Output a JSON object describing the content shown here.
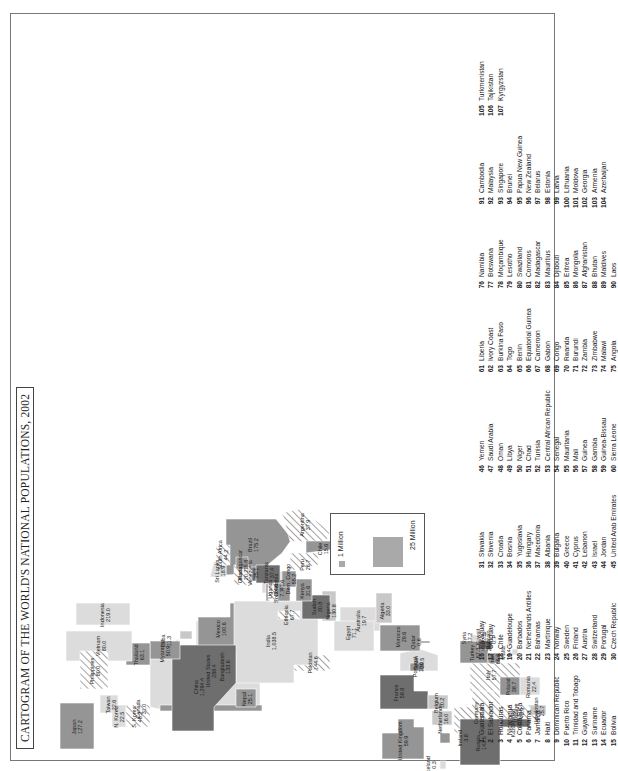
{
  "title": "CARTOGRAM OF THE WORLD'S NATIONAL POPULATIONS, 2002",
  "legend": {
    "small_label": "1 Million",
    "big_label": "25 Million"
  },
  "colors": {
    "dark": "#6e6e6e",
    "medium": "#959595",
    "light": "#c8c8c8",
    "lighter": "#dcdcdc",
    "hatch": "#9a9a9a",
    "frame": "#777777"
  },
  "regions": [
    {
      "name": "United States",
      "value": "288.4"
    },
    {
      "name": "Canada",
      "value": "31.0"
    },
    {
      "name": "Mexico",
      "value": "100.6"
    },
    {
      "name": "Cuba",
      "value": "11.3"
    },
    {
      "name": "Brazil",
      "value": "175.2"
    },
    {
      "name": "Colombia",
      "value": "41.6"
    },
    {
      "name": "Venezuela",
      "value": "25.1"
    },
    {
      "name": "Peru",
      "value": "26.7"
    },
    {
      "name": "Argentina",
      "value": "37.9"
    },
    {
      "name": "Chile",
      "value": "15.6"
    },
    {
      "name": "Iceland",
      "value": "0.3"
    },
    {
      "name": "Ireland",
      "value": "3.8"
    },
    {
      "name": "United Kingdom",
      "value": "59.9"
    },
    {
      "name": "France",
      "value": "59.8"
    },
    {
      "name": "Spain",
      "value": "39.5"
    },
    {
      "name": "Portugal",
      "value": "10.0"
    },
    {
      "name": "Belgium",
      "value": "10.2"
    },
    {
      "name": "Netherlands",
      "value": "16.0"
    },
    {
      "name": "Germany",
      "value": "81.4"
    },
    {
      "name": "Italy",
      "value": "57.7"
    },
    {
      "name": "Malta",
      "value": "0.4"
    },
    {
      "name": "Poland",
      "value": "38.7"
    },
    {
      "name": "Romania",
      "value": "22.4"
    },
    {
      "name": "Ukraine",
      "value": "48.9"
    },
    {
      "name": "Russia",
      "value": "143.5"
    },
    {
      "name": "Kazakhstan",
      "value": "15.0"
    },
    {
      "name": "Uzbekistan",
      "value": "25.7"
    },
    {
      "name": "Turkey",
      "value": "67.3"
    },
    {
      "name": "Iran",
      "value": "66.6"
    },
    {
      "name": "Iraq",
      "value": "24.4"
    },
    {
      "name": "Syria",
      "value": "17.2"
    },
    {
      "name": "Kuwait",
      "value": "2.3"
    },
    {
      "name": "Bahrain",
      "value": "0.7"
    },
    {
      "name": "Qatar",
      "value": "0.6"
    },
    {
      "name": "Pakistan",
      "value": "144.6"
    },
    {
      "name": "India",
      "value": "1,038.5"
    },
    {
      "name": "Nepal",
      "value": "25.1"
    },
    {
      "name": "Bangladesh",
      "value": "133.6"
    },
    {
      "name": "Sri Lanka",
      "value": "18.9"
    },
    {
      "name": "China",
      "value": "1,294.4"
    },
    {
      "name": "Myanmar",
      "value": "50.9"
    },
    {
      "name": "Thailand",
      "value": "63.1"
    },
    {
      "name": "Vietnam",
      "value": "80.0"
    },
    {
      "name": "Taiwan",
      "value": "22.6"
    },
    {
      "name": "N. Korea",
      "value": "22.5"
    },
    {
      "name": "S. Korea",
      "value": "48.2"
    },
    {
      "name": "Japan",
      "value": "127.2"
    },
    {
      "name": "Philippines",
      "value": "80.0"
    },
    {
      "name": "Indonesia",
      "value": "219.0"
    },
    {
      "name": "Australia",
      "value": "19.7"
    },
    {
      "name": "Egypt",
      "value": "71.1"
    },
    {
      "name": "Algeria",
      "value": "33.0"
    },
    {
      "name": "Morocco",
      "value": "29.6"
    },
    {
      "name": "Nigeria",
      "value": "130.8"
    },
    {
      "name": "Sudan",
      "value": "30.8"
    },
    {
      "name": "Ethiopia",
      "value": "67.7"
    },
    {
      "name": "Somalia",
      "value": "7.7"
    },
    {
      "name": "Kenya",
      "value": "31.6"
    },
    {
      "name": "Uganda",
      "value": "24.6"
    },
    {
      "name": "Tanzania",
      "value": "37.4"
    },
    {
      "name": "Dem. Congo",
      "value": "55.2"
    },
    {
      "name": "Ghana",
      "value": "20.2"
    },
    {
      "name": "South Africa",
      "value": "44.2"
    },
    {
      "name": "Madagascar",
      "value": "15.8"
    }
  ],
  "key": [
    [
      {
        "n": "1",
        "name": "Guatemala"
      },
      {
        "n": "2",
        "name": "El Salvador"
      },
      {
        "n": "3",
        "name": "Honduras"
      },
      {
        "n": "4",
        "name": "Nicaragua"
      },
      {
        "n": "5",
        "name": "Costa Rica"
      },
      {
        "n": "6",
        "name": "Panama"
      },
      {
        "n": "7",
        "name": "Jamaica"
      },
      {
        "n": "8",
        "name": "Haiti"
      },
      {
        "n": "9",
        "name": "Dominican Republic"
      },
      {
        "n": "10",
        "name": "Puerto Rico"
      },
      {
        "n": "11",
        "name": "Trinidad and Tobago"
      },
      {
        "n": "12",
        "name": "Guyana"
      },
      {
        "n": "13",
        "name": "Suriname"
      },
      {
        "n": "14",
        "name": "Ecuador"
      },
      {
        "n": "15",
        "name": "Bolivia"
      }
    ],
    [
      {
        "n": "16",
        "name": "Paraguay"
      },
      {
        "n": "17",
        "name": "Uruguay"
      },
      {
        "n": "18",
        "name": "Chile"
      },
      {
        "n": "19",
        "name": "Guadeloupe"
      },
      {
        "n": "20",
        "name": "Barbados"
      },
      {
        "n": "21",
        "name": "Netherlands Antilles"
      },
      {
        "n": "22",
        "name": "Bahamas"
      },
      {
        "n": "23",
        "name": "Martinique"
      },
      {
        "n": "24",
        "name": "Norway"
      },
      {
        "n": "25",
        "name": "Sweden"
      },
      {
        "n": "26",
        "name": "Finland"
      },
      {
        "n": "27",
        "name": "Austria"
      },
      {
        "n": "28",
        "name": "Switzerland"
      },
      {
        "n": "29",
        "name": "Portugal"
      },
      {
        "n": "30",
        "name": "Czech Republic"
      }
    ],
    [
      {
        "n": "31",
        "name": "Slovakia"
      },
      {
        "n": "32",
        "name": "Slovenia"
      },
      {
        "n": "33",
        "name": "Croatia"
      },
      {
        "n": "34",
        "name": "Bosnia"
      },
      {
        "n": "35",
        "name": "Yugoslavia"
      },
      {
        "n": "36",
        "name": "Hungary"
      },
      {
        "n": "37",
        "name": "Macedonia"
      },
      {
        "n": "38",
        "name": "Albania"
      },
      {
        "n": "39",
        "name": "Bulgaria"
      },
      {
        "n": "40",
        "name": "Greece"
      },
      {
        "n": "41",
        "name": "Cyprus"
      },
      {
        "n": "42",
        "name": "Lebanon"
      },
      {
        "n": "43",
        "name": "Israel"
      },
      {
        "n": "44",
        "name": "Jordan"
      },
      {
        "n": "45",
        "name": "United Arab Emirates"
      }
    ],
    [
      {
        "n": "46",
        "name": "Yemen"
      },
      {
        "n": "47",
        "name": "Saudi Arabia"
      },
      {
        "n": "48",
        "name": "Oman"
      },
      {
        "n": "49",
        "name": "Libya"
      },
      {
        "n": "50",
        "name": "Niger"
      },
      {
        "n": "51",
        "name": "Chad"
      },
      {
        "n": "52",
        "name": "Tunisia"
      },
      {
        "n": "53",
        "name": "Central African Republic"
      },
      {
        "n": "54",
        "name": "Senegal"
      },
      {
        "n": "55",
        "name": "Mauritania"
      },
      {
        "n": "56",
        "name": "Mali"
      },
      {
        "n": "57",
        "name": "Guinea"
      },
      {
        "n": "58",
        "name": "Gambia"
      },
      {
        "n": "59",
        "name": "Guinea-Bissau"
      },
      {
        "n": "60",
        "name": "Sierra Leone"
      }
    ],
    [
      {
        "n": "61",
        "name": "Liberia"
      },
      {
        "n": "62",
        "name": "Ivory Coast"
      },
      {
        "n": "63",
        "name": "Burkina Faso"
      },
      {
        "n": "64",
        "name": "Togo"
      },
      {
        "n": "65",
        "name": "Benin"
      },
      {
        "n": "66",
        "name": "Equatorial Guinea"
      },
      {
        "n": "67",
        "name": "Cameroon"
      },
      {
        "n": "68",
        "name": "Gabon"
      },
      {
        "n": "69",
        "name": "Congo"
      },
      {
        "n": "70",
        "name": "Rwanda"
      },
      {
        "n": "71",
        "name": "Burundi"
      },
      {
        "n": "72",
        "name": "Zambia"
      },
      {
        "n": "73",
        "name": "Zimbabwe"
      },
      {
        "n": "74",
        "name": "Malawi"
      },
      {
        "n": "75",
        "name": "Angola"
      }
    ],
    [
      {
        "n": "76",
        "name": "Namibia"
      },
      {
        "n": "77",
        "name": "Botswana"
      },
      {
        "n": "78",
        "name": "Moçambique"
      },
      {
        "n": "79",
        "name": "Lesotho"
      },
      {
        "n": "80",
        "name": "Swaziland"
      },
      {
        "n": "81",
        "name": "Comoros"
      },
      {
        "n": "82",
        "name": "Madagascar"
      },
      {
        "n": "83",
        "name": "Mauritius"
      },
      {
        "n": "84",
        "name": "Djibouti"
      },
      {
        "n": "85",
        "name": "Eritrea"
      },
      {
        "n": "86",
        "name": "Mongolia"
      },
      {
        "n": "87",
        "name": "Afghanistan"
      },
      {
        "n": "88",
        "name": "Bhutan"
      },
      {
        "n": "89",
        "name": "Maldives"
      },
      {
        "n": "90",
        "name": "Laos"
      }
    ],
    [
      {
        "n": "91",
        "name": "Cambodia"
      },
      {
        "n": "92",
        "name": "Malaysia"
      },
      {
        "n": "93",
        "name": "Singapore"
      },
      {
        "n": "94",
        "name": "Brunei"
      },
      {
        "n": "95",
        "name": "Papua New Guinea"
      },
      {
        "n": "96",
        "name": "New Zealand"
      },
      {
        "n": "97",
        "name": "Belarus"
      },
      {
        "n": "98",
        "name": "Estonia"
      },
      {
        "n": "99",
        "name": "Latvia"
      },
      {
        "n": "100",
        "name": "Lithuania"
      },
      {
        "n": "101",
        "name": "Moldova"
      },
      {
        "n": "102",
        "name": "Georgia"
      },
      {
        "n": "103",
        "name": "Armenia"
      },
      {
        "n": "104",
        "name": "Azerbaijan"
      }
    ],
    [
      {
        "n": "105",
        "name": "Turkmenistan"
      },
      {
        "n": "106",
        "name": "Tajikistan"
      },
      {
        "n": "107",
        "name": "Kyrgyzstan"
      }
    ]
  ]
}
